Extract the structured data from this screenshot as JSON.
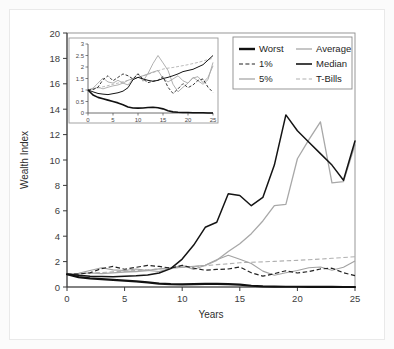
{
  "chart_data": {
    "type": "line",
    "title": "",
    "xlabel": "Years",
    "ylabel": "Wealth Index",
    "xlim": [
      0,
      25
    ],
    "ylim": [
      0,
      20
    ],
    "xticks": [
      0,
      5,
      10,
      15,
      20,
      25
    ],
    "yticks": [
      0,
      2,
      4,
      6,
      8,
      10,
      12,
      14,
      16,
      18,
      20
    ],
    "grid": false,
    "legend_position": "top-right",
    "x": [
      0,
      1,
      2,
      3,
      4,
      5,
      6,
      7,
      8,
      9,
      10,
      11,
      12,
      13,
      14,
      15,
      16,
      17,
      18,
      19,
      20,
      21,
      22,
      23,
      24,
      25
    ],
    "series": [
      {
        "name": "Worst",
        "style": "solid-thick-black",
        "color": "#111111",
        "values": [
          1.0,
          0.78,
          0.68,
          0.62,
          0.56,
          0.5,
          0.44,
          0.36,
          0.26,
          0.22,
          0.21,
          0.22,
          0.24,
          0.25,
          0.23,
          0.18,
          0.1,
          0.05,
          0.03,
          0.02,
          0.02,
          0.01,
          0.01,
          0.01,
          0.0,
          0.0
        ]
      },
      {
        "name": "1%",
        "style": "dashed-black",
        "color": "#222222",
        "values": [
          1.0,
          1.02,
          1.12,
          1.45,
          1.62,
          1.4,
          1.55,
          1.7,
          1.62,
          1.48,
          1.7,
          1.48,
          1.32,
          1.38,
          1.42,
          1.58,
          1.12,
          0.85,
          1.05,
          1.28,
          1.1,
          1.22,
          1.42,
          1.48,
          1.12,
          0.9
        ]
      },
      {
        "name": "5%",
        "style": "solid-gray",
        "color": "#a2a2a2",
        "values": [
          1.0,
          1.08,
          1.3,
          1.52,
          1.35,
          1.3,
          1.42,
          1.3,
          1.22,
          1.48,
          1.72,
          1.38,
          1.72,
          2.15,
          2.5,
          2.18,
          1.85,
          1.25,
          0.92,
          1.12,
          1.3,
          1.52,
          1.58,
          1.32,
          1.55,
          2.05
        ]
      },
      {
        "name": "Average",
        "style": "solid-gray",
        "color": "#a8a8a8",
        "values": [
          1.0,
          1.05,
          1.12,
          1.05,
          1.12,
          1.18,
          1.22,
          1.3,
          1.42,
          1.5,
          1.55,
          1.62,
          1.7,
          2.1,
          2.8,
          3.4,
          4.2,
          5.2,
          6.4,
          6.5,
          10.1,
          11.6,
          13.0,
          8.2,
          8.3,
          11.2
        ]
      },
      {
        "name": "Median",
        "style": "solid-black",
        "color": "#141414",
        "values": [
          1.0,
          0.92,
          0.85,
          0.82,
          0.8,
          0.84,
          0.88,
          0.95,
          1.1,
          1.45,
          2.2,
          3.3,
          4.7,
          5.1,
          7.35,
          7.2,
          6.4,
          7.05,
          9.6,
          13.55,
          12.3,
          11.4,
          10.5,
          9.6,
          8.4,
          11.5
        ]
      },
      {
        "name": "T-Bills",
        "style": "dashed-gray",
        "color": "#b0b0b0",
        "values": [
          1.0,
          1.04,
          1.09,
          1.14,
          1.19,
          1.25,
          1.3,
          1.36,
          1.42,
          1.48,
          1.55,
          1.61,
          1.68,
          1.76,
          1.83,
          1.91,
          1.95,
          1.98,
          2.02,
          2.06,
          2.1,
          2.15,
          2.2,
          2.26,
          2.32,
          2.38
        ]
      }
    ],
    "inset": {
      "type": "line",
      "xlim": [
        0,
        25
      ],
      "ylim": [
        0,
        3
      ],
      "xticks": [
        0,
        5,
        10,
        15,
        20,
        25
      ],
      "yticks": [
        0,
        0.5,
        1,
        1.5,
        2,
        2.5,
        3
      ],
      "ytick_labels": [
        "0",
        "0.5",
        "1",
        "1.5",
        "2",
        "2.5",
        "3"
      ],
      "xtick_labels": [
        "0",
        "5",
        "10",
        "15",
        "20",
        "25"
      ],
      "x": [
        0,
        1,
        2,
        3,
        4,
        5,
        6,
        7,
        8,
        9,
        10,
        11,
        12,
        13,
        14,
        15,
        16,
        17,
        18,
        19,
        20,
        21,
        22,
        23,
        24,
        25
      ],
      "series": [
        {
          "name": "Worst",
          "values": [
            1.0,
            0.78,
            0.68,
            0.62,
            0.56,
            0.5,
            0.44,
            0.36,
            0.26,
            0.22,
            0.21,
            0.22,
            0.24,
            0.25,
            0.23,
            0.18,
            0.1,
            0.05,
            0.03,
            0.02,
            0.02,
            0.01,
            0.01,
            0.01,
            0.0,
            0.0
          ]
        },
        {
          "name": "1%",
          "values": [
            1.0,
            1.02,
            1.12,
            1.45,
            1.62,
            1.4,
            1.55,
            1.7,
            1.62,
            1.48,
            1.7,
            1.48,
            1.32,
            1.38,
            1.42,
            1.58,
            1.12,
            0.85,
            1.05,
            1.28,
            1.1,
            1.22,
            1.42,
            1.48,
            1.12,
            0.9
          ]
        },
        {
          "name": "5%",
          "values": [
            1.0,
            1.08,
            1.3,
            1.52,
            1.35,
            1.3,
            1.42,
            1.3,
            1.22,
            1.48,
            1.72,
            1.38,
            1.72,
            2.15,
            2.5,
            2.18,
            1.85,
            1.25,
            0.92,
            1.12,
            1.3,
            1.52,
            1.58,
            1.32,
            1.55,
            2.05
          ]
        },
        {
          "name": "Average",
          "values": [
            1.0,
            1.05,
            1.12,
            1.05,
            1.12,
            1.18,
            1.22,
            1.3,
            1.42,
            1.5,
            1.55,
            1.62,
            1.7,
            1.78,
            1.85,
            1.5,
            1.35,
            1.48,
            1.62,
            1.4,
            1.3,
            1.55,
            1.4,
            1.25,
            1.45,
            2.2
          ]
        },
        {
          "name": "Median",
          "values": [
            1.0,
            0.92,
            0.85,
            0.82,
            0.8,
            0.84,
            0.88,
            0.95,
            1.1,
            1.45,
            1.55,
            1.48,
            1.42,
            1.38,
            1.42,
            1.5,
            1.55,
            1.62,
            1.7,
            1.8,
            1.85,
            1.9,
            2.0,
            2.1,
            2.3,
            2.5
          ]
        },
        {
          "name": "T-Bills",
          "values": [
            1.0,
            1.04,
            1.09,
            1.14,
            1.19,
            1.25,
            1.3,
            1.36,
            1.42,
            1.48,
            1.55,
            1.61,
            1.68,
            1.76,
            1.83,
            1.91,
            1.95,
            1.98,
            2.02,
            2.06,
            2.1,
            2.15,
            2.2,
            2.26,
            2.32,
            2.38
          ]
        }
      ]
    }
  },
  "legend": {
    "entries": [
      {
        "label": "Worst",
        "style": "solid-thick-black"
      },
      {
        "label": "Average",
        "style": "solid-gray"
      },
      {
        "label": "1%",
        "style": "dashed-black"
      },
      {
        "label": "Median",
        "style": "solid-black"
      },
      {
        "label": "5%",
        "style": "solid-gray"
      },
      {
        "label": "T-Bills",
        "style": "dashed-gray"
      }
    ]
  },
  "axis": {
    "x_title": "Years",
    "y_title": "Wealth Index",
    "x_tick_labels": [
      "0",
      "5",
      "10",
      "15",
      "20",
      "25"
    ],
    "y_tick_labels": [
      "0",
      "2",
      "4",
      "6",
      "8",
      "10",
      "12",
      "14",
      "16",
      "18",
      "20"
    ]
  },
  "colors": {
    "worst": "#111111",
    "median": "#141414",
    "pct1": "#222222",
    "pct5": "#a2a2a2",
    "average": "#a8a8a8",
    "tbills": "#b0b0b0",
    "axis": "#3a3a3a",
    "frame": "#8c8c8c",
    "background": "#ffffff"
  }
}
